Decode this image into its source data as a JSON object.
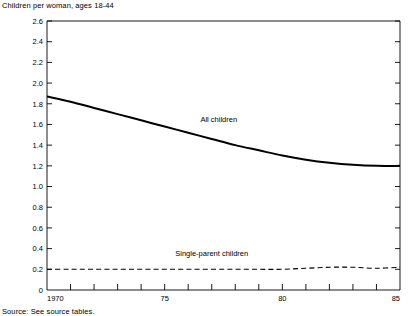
{
  "header": {
    "axis_caption": "Children per woman, ages 18-44"
  },
  "footer": {
    "source": "Source: See source tables."
  },
  "labels": {
    "all_children": "All children",
    "single_parent_children": "Single-parent children"
  },
  "colors": {
    "line": "#000000",
    "axis": "#000000",
    "background": "#ffffff"
  },
  "chart_data": {
    "type": "line",
    "title": "",
    "subtitle": "",
    "xlabel": "",
    "ylabel": "Children per woman, ages 18-44",
    "xlim": [
      1970,
      1985
    ],
    "ylim": [
      0,
      2.6
    ],
    "grid": false,
    "legend": "inline-annotations",
    "yticks": [
      0,
      0.2,
      0.4,
      0.6,
      0.8,
      1.0,
      1.2,
      1.4,
      1.6,
      1.8,
      2.0,
      2.2,
      2.4,
      2.6
    ],
    "ytick_labels": [
      "0",
      "0.2",
      "0.4",
      "0.6",
      "0.8",
      "1.0",
      "1.2",
      "1.4",
      "1.6",
      "1.8",
      "2.0",
      "2.2",
      "2.4",
      "2.6"
    ],
    "xticks": [
      1970,
      1971,
      1972,
      1973,
      1974,
      1975,
      1976,
      1977,
      1978,
      1979,
      1980,
      1981,
      1982,
      1983,
      1984,
      1985
    ],
    "xtick_labels": [
      "1970",
      "",
      "",
      "",
      "",
      "75",
      "",
      "",
      "",
      "",
      "80",
      "",
      "",
      "",
      "",
      "85"
    ],
    "x": [
      1970,
      1971,
      1972,
      1973,
      1974,
      1975,
      1976,
      1977,
      1978,
      1979,
      1980,
      1981,
      1982,
      1983,
      1984,
      1985
    ],
    "series": [
      {
        "name": "All children",
        "style": "solid",
        "label_x": 1977.3,
        "label_y": 1.62,
        "values": [
          1.87,
          1.82,
          1.76,
          1.7,
          1.64,
          1.58,
          1.52,
          1.46,
          1.4,
          1.35,
          1.3,
          1.26,
          1.23,
          1.21,
          1.2,
          1.2
        ]
      },
      {
        "name": "Single-parent children",
        "style": "dashed",
        "label_x": 1977.0,
        "label_y": 0.33,
        "values": [
          0.2,
          0.2,
          0.2,
          0.2,
          0.2,
          0.2,
          0.2,
          0.2,
          0.2,
          0.2,
          0.2,
          0.21,
          0.22,
          0.22,
          0.21,
          0.22
        ]
      }
    ]
  }
}
